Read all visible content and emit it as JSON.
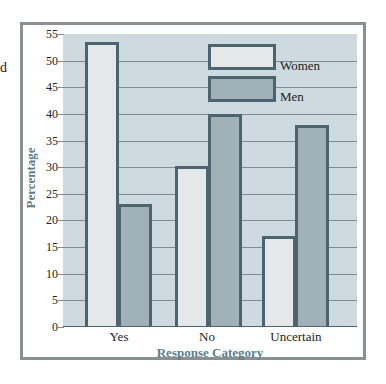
{
  "chart_data": {
    "type": "bar",
    "title": "",
    "xlabel": "Response Category",
    "ylabel": "Percentage",
    "categories": [
      "Yes",
      "No",
      "Uncertain"
    ],
    "series": [
      {
        "name": "Women",
        "values": [
          53.5,
          30.3,
          17
        ],
        "color": "#e4e8e9"
      },
      {
        "name": "Men",
        "values": [
          23,
          40,
          38
        ],
        "color": "#a0b1b8"
      }
    ],
    "ylim": [
      0,
      55
    ],
    "yticks": [
      "0",
      "5",
      "10",
      "15",
      "20",
      "25",
      "30",
      "35",
      "40",
      "45",
      "50",
      "55"
    ],
    "grid": true,
    "legend_position": "upper-right-inside",
    "plot_background": "#cddbe0"
  },
  "legend": {
    "women_label": "Women",
    "men_label": "Men"
  },
  "axes": {
    "x_title": "Response Category",
    "y_title": "Percentage",
    "categories": [
      "Yes",
      "No",
      "Uncertain"
    ]
  },
  "edge_text": "d"
}
